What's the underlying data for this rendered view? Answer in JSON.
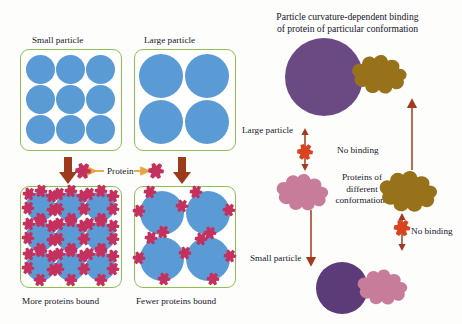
{
  "figure": {
    "background_color": "#fdfdfb"
  },
  "colors": {
    "particle_blue": "#5B9BD5",
    "particle_purple": "#6B4A84",
    "protein_crimson": "#C4315F",
    "protein_pink": "#C77D99",
    "protein_gold": "#97721A",
    "box_green": "#8CC152",
    "arrow_dark_red": "#A33A1E",
    "arrow_orange": "#E8A33D",
    "text": "#17172b"
  },
  "left_panel": {
    "top_labels": {
      "small": "Small particle",
      "large": "Large particle"
    },
    "middle_label": "Protein",
    "bottom_labels": {
      "more": "More proteins bound",
      "fewer": "Fewer proteins bound"
    },
    "small_particle_count": 9,
    "large_particle_count": 4,
    "small_particle_radius_px": 17,
    "large_particle_radius_px": 26
  },
  "right_panel": {
    "title_line1": "Particle curvature-dependent binding",
    "title_line2": "of protein of particular conformation",
    "large_particle_label": "Large particle",
    "small_particle_label": "Small particle",
    "proteins_label_line1": "Proteins of",
    "proteins_label_line2": "different",
    "proteins_label_line3": "conformations",
    "no_binding_upper": "No binding",
    "no_binding_lower": "No binding"
  }
}
